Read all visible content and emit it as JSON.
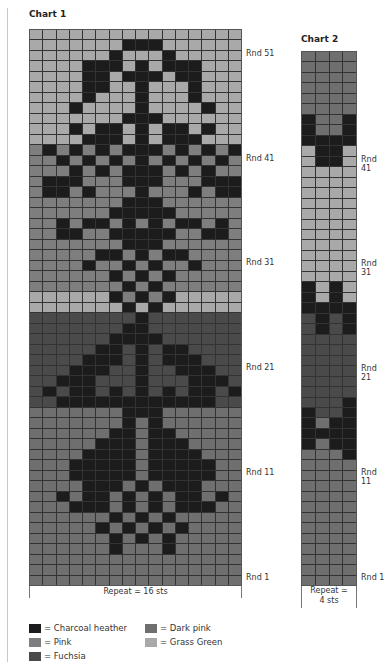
{
  "colors": {
    "C": "#1c1c1c",
    "D": "#6f6f6f",
    "P": "#7e7e7e",
    "G": "#a9a9a9",
    "F": "#4a4a4a"
  },
  "chart1": {
    "title": "Chart 1",
    "repeat_label": "Repeat = 16 sts",
    "round_labels": [
      {
        "label": "Rnd 51",
        "row": 51
      },
      {
        "label": "Rnd 41",
        "row": 41
      },
      {
        "label": "Rnd 31",
        "row": 31
      },
      {
        "label": "Rnd 21",
        "row": 21
      },
      {
        "label": "Rnd 11",
        "row": 11
      },
      {
        "label": "Rnd 1",
        "row": 1
      }
    ],
    "rows_top_to_bottom": [
      "GGGGGGGGGGGGGGGG",
      "GGGGGGGCCCGGGGGG",
      "GGGGGGCGGGCGGGGG",
      "GGGGCCCGCGCCCGGG",
      "GGGGCCGCCCGCCGGG",
      "GGGGCCGGCGGGCGGG",
      "GGGGCGGGCGGGCGGG",
      "GGGCGGGGCGGGGCGG",
      "GGGGGGGCCCGGGGGG",
      "GGGCGCCGCGCCGCGG",
      "GGGGCCCGCGCCCGGG",
      "PCPCPCPCCCPCPCPC",
      "PPCPCPCPCPCPCPCP",
      "PPPCPCPCCCPCPCPP",
      "PCCCPPPCCCPPPCCC",
      "PCCPCPPPCPPPCPCC",
      "PPPPPPPCCCPPPPPP",
      "PPPPPPCCCCCPPPPP",
      "PPCPCCPCPCPCCPCP",
      "PPCCPPCCCCCPPCCP",
      "PPPPPPPCCCPPPPPP",
      "PPPPPCCPCPCCPPPP",
      "PPPPCPPCPCPPCPPP",
      "PPPPPPCPCPCPPPPP",
      "PPPPPPPCPCPPPPPP",
      "GGGGGGCPCPCGGGGG",
      "GGGGGGGCGCGGGGGG",
      "FFFFFFFFCFFFFFFF",
      "FFFFFFFCCFFFFFFF",
      "FFFFFFCCCCFFFFFF",
      "FFFFFCCFCFCCFFFF",
      "FFFFCCCFCFCCCFFF",
      "FFFCCCFFCFFCCCFF",
      "FFCCCFFFCFFFCCCF",
      "FCFCCFCFCFCFCCFC",
      "FFCCCCCCCCCCCCFF",
      "DDDDDDDCCCDDDDDD",
      "DDDDDDDCDCDDDDDD",
      "DDDDDDCCDCCDDDDD",
      "DDDDDCCCDCCCDDDD",
      "DDDDCCCCDCCCCDDD",
      "DDDCCCCCDCCCCCDD",
      "DDDCCCCCDCCCCCDD",
      "DDDDCCCDCDCCCDDD",
      "DDCDCCDCDCDCCDCD",
      "DDDCCCDCDCDCCCDD",
      "DDDDDDCDCDCDDDDD",
      "DDDDDCDCDCDCDDDD",
      "DDDDDDCDCDCDDDDD",
      "DDDDDDCDDDCDDDDD",
      "DDDDDDDDDDDDDDDD",
      "DDDDDDDDDDDDDDDD",
      "DDDDDDDDDDDDDDDD"
    ]
  },
  "chart2": {
    "title": "Chart 2",
    "repeat_label_line1": "Repeat =",
    "repeat_label_line2": "4 sts",
    "round_labels": [
      {
        "label": "Rnd 41",
        "row": 41
      },
      {
        "label": "Rnd 31",
        "row": 31
      },
      {
        "label": "Rnd 21",
        "row": 21
      },
      {
        "label": "Rnd 11",
        "row": 11
      },
      {
        "label": "Rnd 1",
        "row": 1
      }
    ],
    "rows_top_to_bottom": [
      "DDDD",
      "DDDD",
      "DDDD",
      "DDDD",
      "DDDD",
      "DDDD",
      "CDDC",
      "CDDC",
      "CCCC",
      "GCCG",
      "GCCG",
      "GGGG",
      "GGGG",
      "GGGG",
      "GGGG",
      "GGGG",
      "GGGG",
      "GGGG",
      "GGGG",
      "GGGG",
      "GGGG",
      "GGGG",
      "CGCG",
      "CGCG",
      "CCCC",
      "FCFC",
      "FCFC",
      "FFFF",
      "FFFF",
      "FFFF",
      "FFFF",
      "FFFF",
      "FFFF",
      "FFFC",
      "CFFC",
      "CDCC",
      "CCCC",
      "CDCC",
      "DDDC",
      "DDDD",
      "DDDD",
      "DDDD",
      "DDDD",
      "DDDD",
      "DDDD",
      "DDDD",
      "DDDD",
      "DDDD",
      "DDDD",
      "DDDD",
      "DDDD"
    ]
  },
  "legend": [
    {
      "key": "C",
      "label": "= Charcoal heather"
    },
    {
      "key": "D",
      "label": "= Dark pink"
    },
    {
      "key": "P",
      "label": "= Pink"
    },
    {
      "key": "G",
      "label": "= Grass Green"
    },
    {
      "key": "F",
      "label": "= Fuchsia"
    }
  ]
}
